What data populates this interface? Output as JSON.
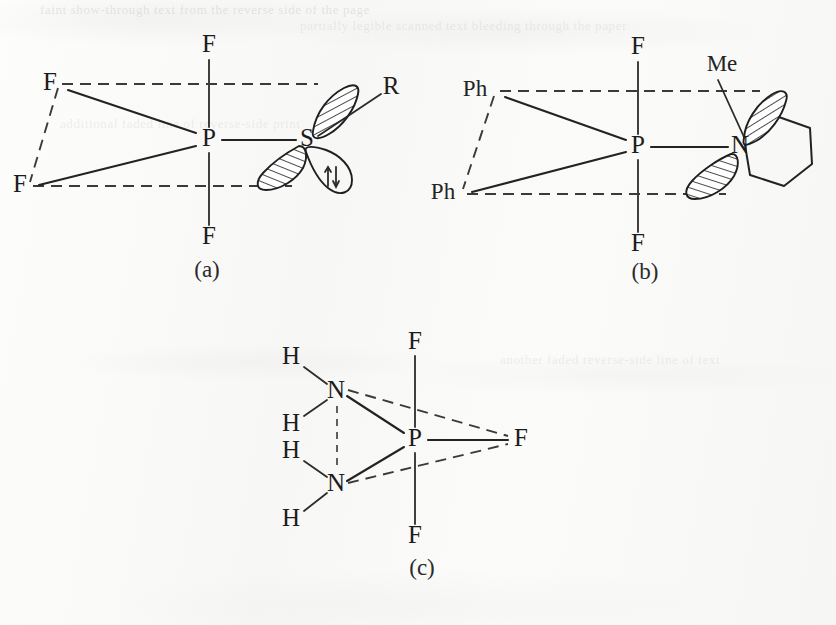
{
  "figure": {
    "background_color": "#fbfbfa",
    "ink_color": "#232323"
  },
  "structures": [
    {
      "id": "a",
      "caption": "(a)",
      "central_atom": "P",
      "axial_atoms": [
        "F",
        "F"
      ],
      "equatorial_atoms": [
        "F",
        "F",
        "S"
      ],
      "substituent": "R",
      "lone_pair_symbol": "↑↓",
      "labels": {
        "axial_top": "F",
        "axial_bottom": "F",
        "equatorial_upper_left": "F",
        "equatorial_lower_left": "F",
        "center": "P",
        "equatorial_right": "S",
        "substituent": "R"
      },
      "lobes": [
        {
          "name": "s-upper-lobe",
          "style": "hatched"
        },
        {
          "name": "s-lower-lobe",
          "style": "hatched"
        },
        {
          "name": "s-lone-pair-lobe",
          "style": "outline"
        }
      ]
    },
    {
      "id": "b",
      "caption": "(b)",
      "central_atom": "P",
      "axial_atoms": [
        "F",
        "F"
      ],
      "equatorial_atoms": [
        "Ph",
        "Ph",
        "N"
      ],
      "substituent": "Me",
      "ring": "piperidino",
      "labels": {
        "axial_top": "F",
        "axial_bottom": "F",
        "equatorial_upper_left": "Ph",
        "equatorial_lower_left": "Ph",
        "center": "P",
        "equatorial_right": "N",
        "substituent": "Me"
      },
      "lobes": [
        {
          "name": "n-upper-lobe",
          "style": "hatched"
        },
        {
          "name": "n-lower-lobe",
          "style": "hatched"
        }
      ]
    },
    {
      "id": "c",
      "caption": "(c)",
      "central_atom": "P",
      "axial_atoms": [
        "F",
        "F"
      ],
      "equatorial_atoms": [
        "N",
        "N",
        "F"
      ],
      "hydrogens": [
        "H",
        "H",
        "H",
        "H"
      ],
      "labels": {
        "axial_top": "F",
        "axial_bottom": "F",
        "center": "P",
        "equatorial_right": "F",
        "equatorial_upper_left": "N",
        "equatorial_lower_left": "N",
        "h_top_outer": "H",
        "h_top_inner": "H",
        "h_bottom_inner": "H",
        "h_bottom_outer": "H"
      }
    }
  ],
  "showthrough": {
    "line1": "faint show-through text from the reverse side of the page",
    "line2": "partially legible scanned text bleeding through the paper",
    "line3": "additional faded line of reverse-side print",
    "line4": "another faded reverse-side line of text"
  }
}
